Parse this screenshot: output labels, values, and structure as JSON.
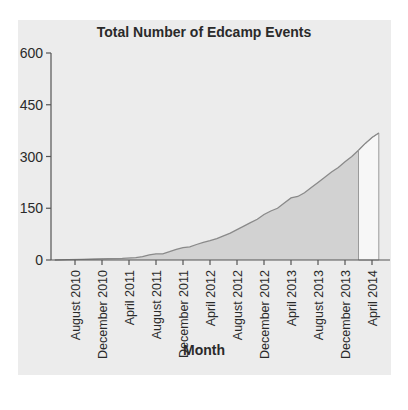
{
  "chart_data": {
    "type": "area",
    "title": "Total Number of Edcamp Events",
    "xlabel": "Month",
    "ylabel": "",
    "ylim": [
      0,
      600
    ],
    "yticks": [
      0,
      150,
      300,
      450,
      600
    ],
    "grid": false,
    "legend": null,
    "x_tick_labels": [
      "August 2010",
      "December 2010",
      "April 2011",
      "August 2011",
      "December 2011",
      "April 2012",
      "August 2012",
      "December 2012",
      "April 2013",
      "August 2013",
      "December 2013",
      "April 2014"
    ],
    "series": [
      {
        "name": "Total Number of Edcamp Events",
        "x": [
          "May 2010",
          "Jul 2010",
          "Sep 2010",
          "Nov 2010",
          "Jan 2011",
          "Mar 2011",
          "May 2011",
          "Jun 2011",
          "Jul 2011",
          "Aug 2011",
          "Sep 2011",
          "Oct 2011",
          "Nov 2011",
          "Dec 2011",
          "Jan 2012",
          "Feb 2012",
          "Mar 2012",
          "Apr 2012",
          "May 2012",
          "Jun 2012",
          "Jul 2012",
          "Aug 2012",
          "Sep 2012",
          "Oct 2012",
          "Nov 2012",
          "Dec 2012",
          "Jan 2013",
          "Feb 2013",
          "Mar 2013",
          "Apr 2013",
          "May 2013",
          "Jun 2013",
          "Jul 2013",
          "Aug 2013",
          "Sep 2013",
          "Oct 2013",
          "Nov 2013",
          "Dec 2013",
          "Jan 2014",
          "Feb 2014",
          "Mar 2014",
          "Apr 2014",
          "May 2014"
        ],
        "values": [
          0,
          1,
          2,
          3,
          4,
          5,
          7,
          10,
          15,
          18,
          18,
          24,
          31,
          36,
          38,
          45,
          51,
          56,
          62,
          70,
          78,
          88,
          98,
          108,
          118,
          132,
          142,
          150,
          165,
          180,
          184,
          195,
          210,
          225,
          240,
          255,
          268,
          285,
          300,
          318,
          338,
          355,
          368
        ]
      }
    ],
    "shading": {
      "dark_fill_until": "Feb 2014",
      "light_fill_after": "Feb 2014"
    }
  }
}
